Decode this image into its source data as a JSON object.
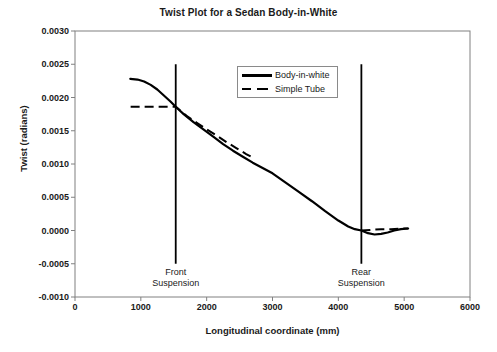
{
  "chart_data": {
    "type": "line",
    "title": "Twist Plot for a Sedan Body-in-White",
    "xlabel": "Longitudinal coordinate (mm)",
    "ylabel": "Twist (radians)",
    "xlim": [
      0,
      6000
    ],
    "ylim": [
      -0.001,
      0.003
    ],
    "xticks": [
      "0",
      "1000",
      "2000",
      "3000",
      "4000",
      "5000",
      "6000"
    ],
    "xtick_values": [
      0,
      1000,
      2000,
      3000,
      4000,
      5000,
      6000
    ],
    "yticks": [
      "0.0030",
      "0.0025",
      "0.0020",
      "0.0015",
      "0.0010",
      "0.0005",
      "0.0000",
      "-0.0005",
      "-0.0010"
    ],
    "ytick_values": [
      0.003,
      0.0025,
      0.002,
      0.0015,
      0.001,
      0.0005,
      0.0,
      -0.0005,
      -0.001
    ],
    "grid": false,
    "legend_position": "upper-center",
    "series": [
      {
        "name": "Body-in-white",
        "style": "solid",
        "color": "#000000",
        "x": [
          840,
          950,
          1050,
          1150,
          1250,
          1350,
          1450,
          1530,
          1650,
          1800,
          1950,
          2100,
          2250,
          2400,
          2550,
          2700,
          2850,
          3000,
          3200,
          3400,
          3600,
          3800,
          4000,
          4150,
          4250,
          4350,
          4450,
          4550,
          4650,
          4750,
          4850,
          4950,
          5060
        ],
        "y": [
          0.00228,
          0.00227,
          0.00224,
          0.00219,
          0.00212,
          0.00203,
          0.00194,
          0.00186,
          0.00175,
          0.00163,
          0.00152,
          0.00141,
          0.0013,
          0.0012,
          0.00111,
          0.00102,
          0.00094,
          0.00086,
          0.00072,
          0.00058,
          0.00044,
          0.00029,
          0.00015,
          6e-05,
          2e-05,
          0.0,
          -4e-05,
          -6e-05,
          -5e-05,
          -3e-05,
          0.0,
          2e-05,
          3e-05
        ]
      },
      {
        "name": "Simple Tube",
        "style": "dashed",
        "color": "#000000",
        "x": [
          845,
          1000,
          1200,
          1400,
          1530,
          1700,
          1850,
          2000,
          2150,
          2300,
          2450,
          2600,
          2700,
          4350,
          4500,
          4650,
          4800,
          4950,
          5060
        ],
        "y": [
          0.00186,
          0.00186,
          0.00186,
          0.00186,
          0.00186,
          0.00172,
          0.00162,
          0.00152,
          0.00143,
          0.00133,
          0.00124,
          0.00115,
          0.0011,
          0.0,
          1e-05,
          2e-05,
          2e-05,
          3e-05,
          3e-05
        ]
      }
    ],
    "annotations": [
      {
        "name": "front-suspension",
        "label_line1": "Front",
        "label_line2": "Suspension",
        "x": 1530,
        "line_ymin": -0.0005,
        "line_ymax": 0.0025
      },
      {
        "name": "rear-suspension",
        "label_line1": "Rear",
        "label_line2": "Suspension",
        "x": 4350,
        "line_ymin": -0.0005,
        "line_ymax": 0.0025
      }
    ]
  }
}
